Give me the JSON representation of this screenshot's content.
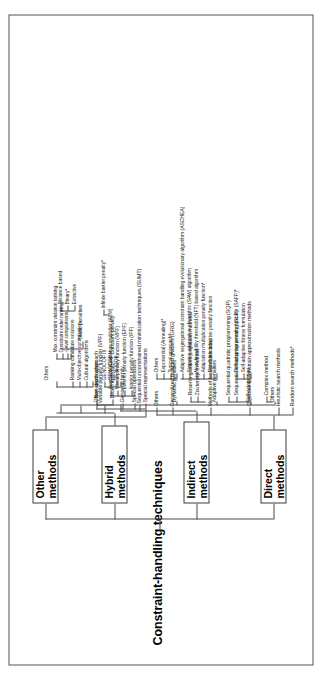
{
  "figure": {
    "title": "Constraint-handling techniques",
    "type": "taxonomy-tree",
    "orientation": "vertical-rotated"
  },
  "branches": {
    "direct": {
      "label": "Direct methods",
      "items": [
        "Random search methods*",
        "Heuristic search methods",
        "Complex method",
        "Objective & Constrain approximation methods",
        "Sequential linear programming (SLP)",
        "Sequential quadratic programming (SQP)",
        "Methods of feasible directions",
        "Zoutendijk's method",
        "Rosen's gradient projection method",
        "Generalized reduced gradient (GRG)",
        "Others"
      ]
    },
    "indirect": {
      "label": "Indirect methods",
      "items": [
        "Sequential unconstrained minimization techniques (SUMT)",
        "Interior penalty function (IPF)",
        "Exterior penalty function (EPF)",
        "Mixed penalty function (MPF)",
        "Augmented lagrange multiplier (ALM)",
        "Variable penalty funcion (VPF)"
      ]
    },
    "hybrid": {
      "label": "Hybrid methods",
      "items": [
        "Death approach",
        "Constant penalty",
        "Infinite barrier penalty*",
        "Non-death approach",
        "Static penalties",
        "Extinctive",
        "Binary*",
        "Distance based",
        "Dynamic penalties",
        "Typical approach*",
        "Exponential (Annealing)*",
        "Others",
        "Adaptive penalties",
        "Feedback adaptive penalty function",
        "Adaptation multiplication penalty function*",
        "Near-feasibility threshold (NFT) based algorithm",
        "Stepwise adaptation of weights (SAW) algorithm",
        "Adaptive segregational constraint handling evolutionary algorithm (ASCHEA)",
        "Self-adaptation",
        "Self-adaptive fitness formulation",
        "Self-adaptive penalty function (SAFP)*",
        "Others"
      ]
    },
    "other": {
      "label": "Other methods",
      "items": [
        "Special representations",
        "Special operations",
        "Genocop family",
        "GENOCOP",
        "GENOCOP II",
        "GENOCOP III",
        "Other approaches",
        "Cultural algorithms",
        "Multi-objective optimization",
        "Ranking candidate solutions",
        "-Level comparisons",
        "Constraint order ranking",
        "Max. constraint violation ranking",
        "Others"
      ]
    }
  },
  "colors": {
    "line": "#4a4a4a",
    "text": "#1c1c1c",
    "border": "#555555"
  }
}
